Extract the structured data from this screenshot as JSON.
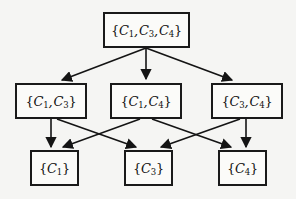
{
  "diagram": {
    "type": "hasse-diagram",
    "background_color": "#f5f5f3",
    "line_color": "#141414",
    "node_fill": "#fbfbf9",
    "node_border": "#1a1a1a",
    "levels": [
      {
        "level": 0,
        "nodes": [
          {
            "id": "n-c1c3c4",
            "label": "{C1, C3, C4}",
            "elements": [
              "C1",
              "C3",
              "C4"
            ],
            "x": 103,
            "y": 12,
            "width": 87,
            "height": 36
          }
        ]
      },
      {
        "level": 1,
        "nodes": [
          {
            "id": "n-c1c3",
            "label": "{C1, C3}",
            "elements": [
              "C1",
              "C3"
            ],
            "x": 15,
            "y": 83,
            "width": 72,
            "height": 36
          },
          {
            "id": "n-c1c4",
            "label": "{C1, C4}",
            "elements": [
              "C1",
              "C4"
            ],
            "x": 110,
            "y": 83,
            "width": 72,
            "height": 36
          },
          {
            "id": "n-c3c4",
            "label": "{C3, C4}",
            "elements": [
              "C3",
              "C4"
            ],
            "x": 211,
            "y": 83,
            "width": 72,
            "height": 36
          }
        ]
      },
      {
        "level": 2,
        "nodes": [
          {
            "id": "n-c1",
            "label": "{C1}",
            "elements": [
              "C1"
            ],
            "x": 30,
            "y": 150,
            "width": 49,
            "height": 36
          },
          {
            "id": "n-c3",
            "label": "{C3}",
            "elements": [
              "C3"
            ],
            "x": 124,
            "y": 150,
            "width": 49,
            "height": 36
          },
          {
            "id": "n-c4",
            "label": "{C4}",
            "elements": [
              "C4"
            ],
            "x": 218,
            "y": 150,
            "width": 49,
            "height": 36
          }
        ]
      }
    ],
    "edges": [
      {
        "id": "e-top-left",
        "from": "n-c1c3c4",
        "to": "n-c1c3"
      },
      {
        "id": "e-top-center",
        "from": "n-c1c3c4",
        "to": "n-c1c4"
      },
      {
        "id": "e-top-right",
        "from": "n-c1c3c4",
        "to": "n-c3c4"
      },
      {
        "id": "e-c1c3-c1",
        "from": "n-c1c3",
        "to": "n-c1"
      },
      {
        "id": "e-c1c3-c3",
        "from": "n-c1c3",
        "to": "n-c3"
      },
      {
        "id": "e-c1c4-c1",
        "from": "n-c1c4",
        "to": "n-c1"
      },
      {
        "id": "e-c1c4-c4",
        "from": "n-c1c4",
        "to": "n-c4"
      },
      {
        "id": "e-c3c4-c3",
        "from": "n-c3c4",
        "to": "n-c3"
      },
      {
        "id": "e-c3c4-c4",
        "from": "n-c3c4",
        "to": "n-c4"
      }
    ]
  }
}
